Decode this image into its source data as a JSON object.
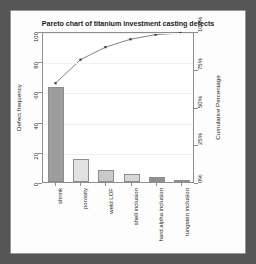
{
  "chart_data": {
    "type": "bar",
    "title": "Pareto chart of titanium investment casting defects",
    "xlabel": "",
    "ylabel": "Defect frequency",
    "y2label": "Cumulative Percentage",
    "categories": [
      "shrink",
      "porosity",
      "weld LOF",
      "shell inclusion",
      "hard alpha inclusion",
      "tungsten inclusion"
    ],
    "values": [
      63,
      15,
      8,
      5,
      3,
      1
    ],
    "cumulative_percent": [
      66.3,
      82.1,
      90.5,
      95.8,
      98.9,
      100.0
    ],
    "ylim": [
      0,
      100
    ],
    "yticks": [
      0,
      20,
      40,
      60,
      80,
      100
    ],
    "yticklabels": [
      "0",
      "20",
      "40",
      "60",
      "80",
      "100"
    ],
    "y2lim": [
      0,
      100
    ],
    "y2ticks": [
      0,
      25,
      50,
      75,
      100
    ],
    "y2ticklabels": [
      "0%",
      "25%",
      "50%",
      "75%",
      "100%"
    ],
    "grid": true,
    "legend": "none",
    "bar_colors": [
      "#9d9d9d",
      "#e2e2e2",
      "#c9c9c9",
      "#d6d6d6",
      "#8f8f8f",
      "#cfcfcf"
    ],
    "bar_edge_color": "#8e8e8e",
    "line_color": "#4a4a4a",
    "marker_color": "#3a3a3a",
    "plot_bg": "#ffffff",
    "card_bg": "#fdfdfd",
    "page_bg": "#565656"
  }
}
